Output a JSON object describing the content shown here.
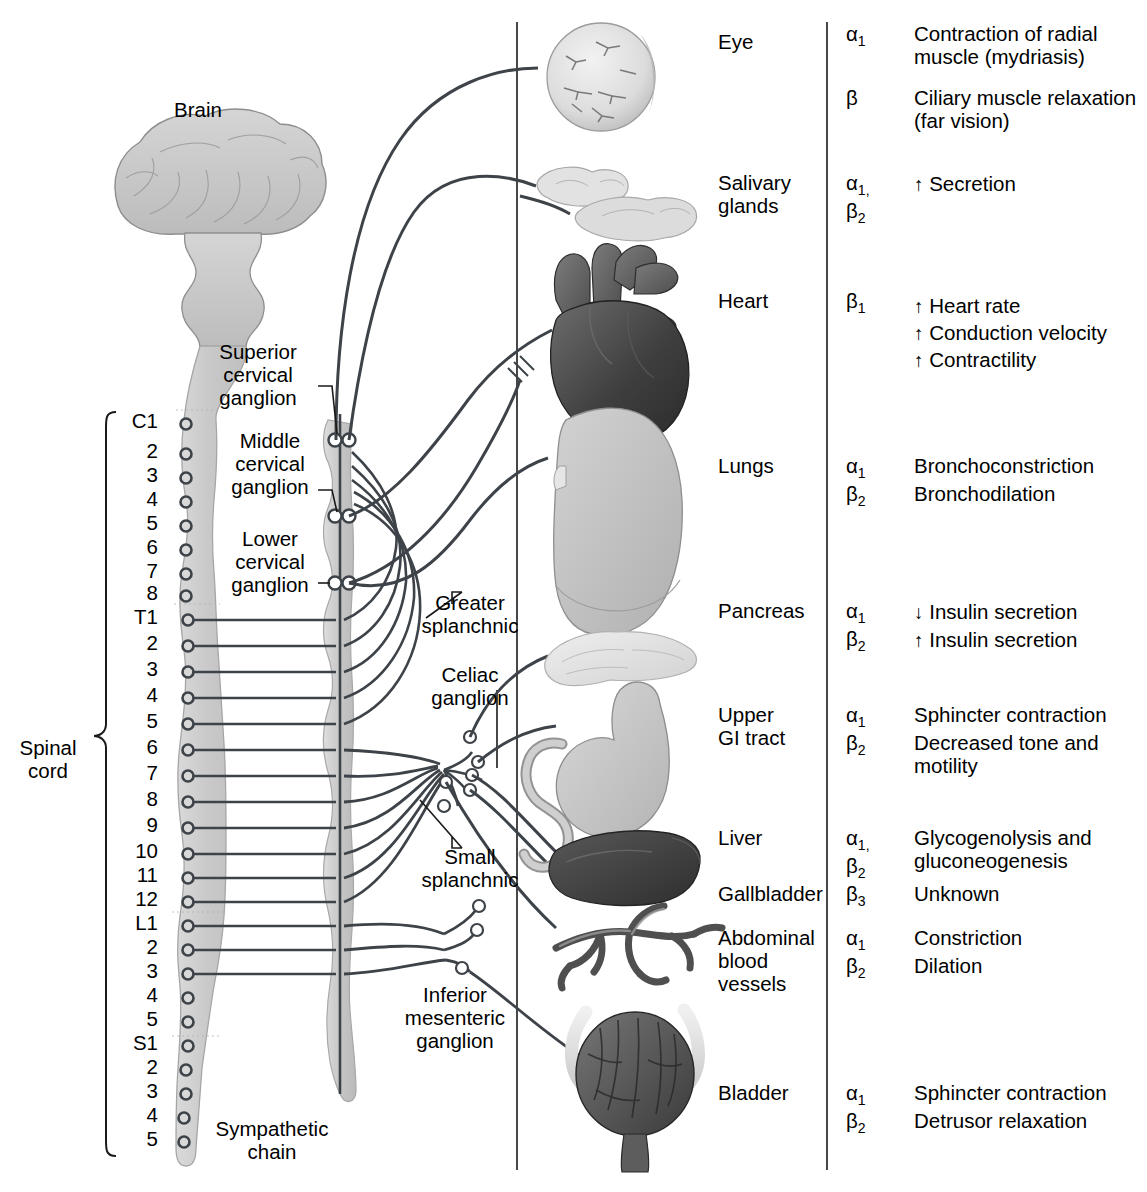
{
  "figure": {
    "title_brain": "Brain",
    "spinal_cord_label": "Spinal\ncord",
    "sympathetic_chain_label": "Sympathetic\nchain"
  },
  "anatomy_labels": [
    {
      "id": "brain",
      "text": "Brain",
      "x": 198,
      "y": 99
    },
    {
      "id": "spinal-cord",
      "text": "Spinal\ncord",
      "x": 48,
      "y": 737
    },
    {
      "id": "superior-cervical-ganglion",
      "text": "Superior\ncervical\nganglion",
      "x": 258,
      "y": 341
    },
    {
      "id": "middle-cervical-ganglion",
      "text": "Middle\ncervical\nganglion",
      "x": 270,
      "y": 430
    },
    {
      "id": "lower-cervical-ganglion",
      "text": "Lower\ncervical\nganglion",
      "x": 270,
      "y": 528
    },
    {
      "id": "greater-splanchnic",
      "text": "Greater\nsplanchnic",
      "x": 470,
      "y": 592
    },
    {
      "id": "celiac-ganglion",
      "text": "Celiac\nganglion",
      "x": 470,
      "y": 664
    },
    {
      "id": "small-splanchnic",
      "text": "Small\nsplanchnic",
      "x": 470,
      "y": 846
    },
    {
      "id": "inferior-mesenteric-ganglion",
      "text": "Inferior\nmesenteric\nganglion",
      "x": 455,
      "y": 984
    },
    {
      "id": "sympathetic-chain",
      "text": "Sympathetic\nchain",
      "x": 272,
      "y": 1118
    }
  ],
  "spinal_segments": [
    {
      "label": "C1",
      "y": 424,
      "sympathetic": false
    },
    {
      "label": "2",
      "y": 454,
      "sympathetic": false
    },
    {
      "label": "3",
      "y": 478,
      "sympathetic": false
    },
    {
      "label": "4",
      "y": 502,
      "sympathetic": false
    },
    {
      "label": "5",
      "y": 526,
      "sympathetic": false
    },
    {
      "label": "6",
      "y": 550,
      "sympathetic": false
    },
    {
      "label": "7",
      "y": 574,
      "sympathetic": false
    },
    {
      "label": "8",
      "y": 596,
      "sympathetic": false
    },
    {
      "label": "T1",
      "y": 620,
      "sympathetic": true
    },
    {
      "label": "2",
      "y": 646,
      "sympathetic": true
    },
    {
      "label": "3",
      "y": 672,
      "sympathetic": true
    },
    {
      "label": "4",
      "y": 698,
      "sympathetic": true
    },
    {
      "label": "5",
      "y": 724,
      "sympathetic": true
    },
    {
      "label": "6",
      "y": 750,
      "sympathetic": true
    },
    {
      "label": "7",
      "y": 776,
      "sympathetic": true
    },
    {
      "label": "8",
      "y": 802,
      "sympathetic": true
    },
    {
      "label": "9",
      "y": 828,
      "sympathetic": true
    },
    {
      "label": "10",
      "y": 854,
      "sympathetic": true
    },
    {
      "label": "11",
      "y": 878,
      "sympathetic": true
    },
    {
      "label": "12",
      "y": 902,
      "sympathetic": true
    },
    {
      "label": "L1",
      "y": 926,
      "sympathetic": true
    },
    {
      "label": "2",
      "y": 950,
      "sympathetic": true
    },
    {
      "label": "3",
      "y": 974,
      "sympathetic": true
    },
    {
      "label": "4",
      "y": 998,
      "sympathetic": false
    },
    {
      "label": "5",
      "y": 1022,
      "sympathetic": false
    },
    {
      "label": "S1",
      "y": 1046,
      "sympathetic": false
    },
    {
      "label": "2",
      "y": 1070,
      "sympathetic": false
    },
    {
      "label": "3",
      "y": 1094,
      "sympathetic": false
    },
    {
      "label": "4",
      "y": 1118,
      "sympathetic": false
    },
    {
      "label": "5",
      "y": 1142,
      "sympathetic": false
    }
  ],
  "organ_rows": [
    {
      "id": "eye",
      "organ": "Eye",
      "organ_y": 44,
      "receptors": [
        {
          "greek": "α",
          "sub": "1",
          "y": 36
        },
        {
          "greek": "β",
          "sub": "",
          "y": 100
        }
      ],
      "effects": [
        {
          "arrow": "",
          "lines": [
            "Contraction of radial",
            "muscle (mydriasis)"
          ],
          "y": 36
        },
        {
          "arrow": "",
          "lines": [
            "Ciliary muscle relaxation",
            "(far vision)"
          ],
          "y": 100
        }
      ]
    },
    {
      "id": "salivary-glands",
      "organ": "Salivary\nglands",
      "organ_y": 185,
      "receptors": [
        {
          "greek": "α",
          "sub": "1,",
          "y": 185
        },
        {
          "greek": "β",
          "sub": "2",
          "y": 213
        }
      ],
      "effects": [
        {
          "arrow": "↑",
          "lines": [
            "Secretion"
          ],
          "y": 186
        }
      ]
    },
    {
      "id": "heart",
      "organ": "Heart",
      "organ_y": 303,
      "receptors": [
        {
          "greek": "β",
          "sub": "1",
          "y": 303
        }
      ],
      "effects": [
        {
          "arrow": "↑",
          "lines": [
            "Heart rate"
          ],
          "y": 308
        },
        {
          "arrow": "↑",
          "lines": [
            "Conduction velocity"
          ],
          "y": 335
        },
        {
          "arrow": "↑",
          "lines": [
            "Contractility"
          ],
          "y": 362
        }
      ]
    },
    {
      "id": "lungs",
      "organ": "Lungs",
      "organ_y": 468,
      "receptors": [
        {
          "greek": "α",
          "sub": "1",
          "y": 468
        },
        {
          "greek": "β",
          "sub": "2",
          "y": 496
        }
      ],
      "effects": [
        {
          "arrow": "",
          "lines": [
            "Bronchoconstriction"
          ],
          "y": 468
        },
        {
          "arrow": "",
          "lines": [
            "Bronchodilation"
          ],
          "y": 496
        }
      ]
    },
    {
      "id": "pancreas",
      "organ": "Pancreas",
      "organ_y": 613,
      "receptors": [
        {
          "greek": "α",
          "sub": "1",
          "y": 613
        },
        {
          "greek": "β",
          "sub": "2",
          "y": 641
        }
      ],
      "effects": [
        {
          "arrow": "↓",
          "lines": [
            "Insulin secretion"
          ],
          "y": 614
        },
        {
          "arrow": "↑",
          "lines": [
            "Insulin secretion"
          ],
          "y": 642
        }
      ]
    },
    {
      "id": "upper-gi-tract",
      "organ": "Upper\nGI tract",
      "organ_y": 717,
      "receptors": [
        {
          "greek": "α",
          "sub": "1",
          "y": 717
        },
        {
          "greek": "β",
          "sub": "2",
          "y": 745
        }
      ],
      "effects": [
        {
          "arrow": "",
          "lines": [
            "Sphincter contraction"
          ],
          "y": 717
        },
        {
          "arrow": "",
          "lines": [
            "Decreased tone and",
            "motility"
          ],
          "y": 745
        }
      ]
    },
    {
      "id": "liver",
      "organ": "Liver",
      "organ_y": 840,
      "receptors": [
        {
          "greek": "α",
          "sub": "1,",
          "y": 840
        },
        {
          "greek": "β",
          "sub": "2",
          "y": 868
        }
      ],
      "effects": [
        {
          "arrow": "",
          "lines": [
            "Glycogenolysis and",
            "gluconeogenesis"
          ],
          "y": 840
        }
      ]
    },
    {
      "id": "gallbladder",
      "organ": "Gallbladder",
      "organ_y": 896,
      "receptors": [
        {
          "greek": "β",
          "sub": "3",
          "y": 896
        }
      ],
      "effects": [
        {
          "arrow": "",
          "lines": [
            "Unknown"
          ],
          "y": 896
        }
      ]
    },
    {
      "id": "abdominal-blood-vessels",
      "organ": "Abdominal\nblood\nvessels",
      "organ_y": 940,
      "receptors": [
        {
          "greek": "α",
          "sub": "1",
          "y": 940
        },
        {
          "greek": "β",
          "sub": "2",
          "y": 968
        }
      ],
      "effects": [
        {
          "arrow": "",
          "lines": [
            "Constriction"
          ],
          "y": 940
        },
        {
          "arrow": "",
          "lines": [
            "Dilation"
          ],
          "y": 968
        }
      ]
    },
    {
      "id": "bladder",
      "organ": "Bladder",
      "organ_y": 1095,
      "receptors": [
        {
          "greek": "α",
          "sub": "1",
          "y": 1095
        },
        {
          "greek": "β",
          "sub": "2",
          "y": 1123
        }
      ],
      "effects": [
        {
          "arrow": "",
          "lines": [
            "Sphincter contraction"
          ],
          "y": 1095
        },
        {
          "arrow": "",
          "lines": [
            "Detrusor relaxation"
          ],
          "y": 1123
        }
      ]
    }
  ],
  "organ_illustrations": [
    {
      "id": "eye-illustration",
      "name": "eye"
    },
    {
      "id": "salivary-glands-illustration",
      "name": "salivary glands"
    },
    {
      "id": "heart-illustration",
      "name": "heart"
    },
    {
      "id": "lung-illustration",
      "name": "lung"
    },
    {
      "id": "pancreas-illustration",
      "name": "pancreas"
    },
    {
      "id": "stomach-illustration",
      "name": "stomach and duodenum"
    },
    {
      "id": "liver-illustration",
      "name": "liver"
    },
    {
      "id": "blood-vessels-illustration",
      "name": "abdominal blood vessels"
    },
    {
      "id": "bladder-illustration",
      "name": "bladder"
    }
  ],
  "colors": {
    "ink": "#1a1a1a",
    "nerve": "#3d4348",
    "cord_fill": "#cfcfcf",
    "cord_edge": "#9a9a9a",
    "chain_fill": "#c8c8c8",
    "organ_light": "#d9d9d9",
    "organ_mid": "#9a9a9a",
    "organ_dark": "#4a4a4a"
  },
  "layout": {
    "divider_x_main": 517,
    "divider_x_receptor": 827,
    "organ_col_x": 718,
    "receptor_col_x": 846,
    "effect_col_x": 914
  }
}
